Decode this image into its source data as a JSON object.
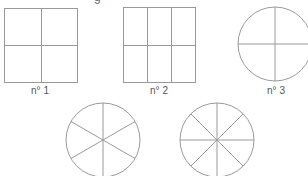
{
  "diagram": {
    "title_fragment": "g",
    "stroke_color": "#9a9a9a",
    "label_color": "#555555",
    "figures": [
      {
        "id": "n1",
        "label": "n° 1",
        "shape": "square",
        "x": 4,
        "y": 8,
        "w": 73,
        "h": 74,
        "cols": 2,
        "rows": 2,
        "label_x": 40,
        "label_y": 86
      },
      {
        "id": "n2",
        "label": "n° 2",
        "shape": "square",
        "x": 123,
        "y": 7,
        "w": 72,
        "h": 75,
        "cols": 3,
        "rows": 2,
        "label_x": 159,
        "label_y": 86
      },
      {
        "id": "n3",
        "label": "n° 3",
        "shape": "circle",
        "cx": 275,
        "cy": 44,
        "r": 37,
        "sectors": 4,
        "start_angle": 0,
        "label_x": 276,
        "label_y": 86
      },
      {
        "id": "n4",
        "label": "",
        "shape": "circle",
        "cx": 103,
        "cy": 140,
        "r": 37,
        "sectors": 6,
        "start_angle": 90
      },
      {
        "id": "n5",
        "label": "",
        "shape": "circle",
        "cx": 217,
        "cy": 140,
        "r": 37,
        "sectors": 8,
        "start_angle": 0
      }
    ]
  }
}
